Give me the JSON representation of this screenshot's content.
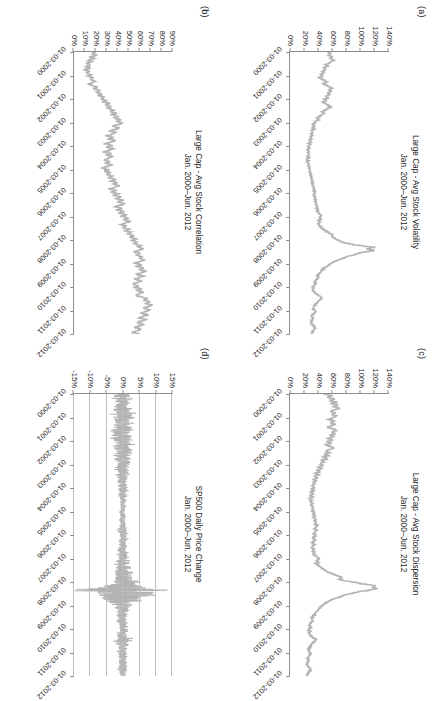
{
  "figure": {
    "orientation": "landscape-rotated-90cw",
    "series_color": "#b3b3b3",
    "axis_color": "#8e8e8e",
    "grid_color": "#bdbdbd"
  },
  "panels": [
    {
      "tag": "(a)",
      "title": "Large Cap - Avg Stock Volatility\nJan. 2000–Jun. 2012",
      "chart_data": {
        "type": "line",
        "title": "Large Cap - Avg Stock Volatility",
        "subtitle": "Jan. 2000–Jun. 2012",
        "xlabel": "",
        "ylabel": "",
        "grid": false,
        "legend": "none",
        "ylim": [
          0,
          140
        ],
        "ytick_labels": [
          "140%",
          "120%",
          "100%",
          "80%",
          "60%",
          "40%",
          "20%",
          "0%"
        ],
        "ytick_values": [
          140,
          120,
          100,
          80,
          60,
          40,
          20,
          0
        ],
        "xtick_labels": [
          "01-03-2000",
          "01-03-2001",
          "01-03-2002",
          "01-03-2003",
          "01-03-2004",
          "01-03-2005",
          "01-03-2006",
          "01-03-2007",
          "01-03-2008",
          "01-03-2009",
          "01-03-2010",
          "01-03-2011",
          "01-03-2012"
        ],
        "series": [
          {
            "name": "Avg Stock Volatility",
            "units": "percent",
            "values": [
              52,
              57,
              54,
              60,
              56,
              62,
              58,
              55,
              50,
              53,
              47,
              50,
              45,
              48,
              43,
              46,
              41,
              44,
              48,
              52,
              46,
              50,
              55,
              59,
              54,
              58,
              52,
              56,
              50,
              54,
              48,
              52,
              46,
              50,
              54,
              58,
              52,
              49,
              45,
              48,
              44,
              41,
              38,
              40,
              36,
              34,
              32,
              34,
              31,
              33,
              30,
              32,
              29,
              31,
              28,
              30,
              27,
              29,
              26,
              28,
              25,
              27,
              24,
              26,
              25,
              27,
              24,
              26,
              23,
              25,
              24,
              26,
              25,
              27,
              26,
              28,
              27,
              29,
              28,
              30,
              29,
              31,
              30,
              32,
              31,
              33,
              32,
              34,
              33,
              35,
              34,
              33,
              35,
              34,
              36,
              35,
              37,
              36,
              38,
              37,
              39,
              38,
              40,
              42,
              44,
              41,
              43,
              40,
              42,
              39,
              41,
              43,
              45,
              48,
              52,
              56,
              60,
              58,
              62,
              66,
              70,
              75,
              85,
              100,
              118,
              110,
              120,
              105,
              95,
              88,
              80,
              74,
              68,
              62,
              58,
              55,
              52,
              48,
              46,
              44,
              42,
              40,
              38,
              40,
              38,
              36,
              34,
              36,
              34,
              32,
              33,
              31,
              33,
              35,
              38,
              42,
              45,
              43,
              40,
              38,
              36,
              34,
              33,
              32,
              34,
              36,
              33,
              31,
              30,
              32,
              31,
              30,
              29,
              31,
              33,
              35,
              34,
              32,
              31,
              30
            ]
          }
        ]
      }
    },
    {
      "tag": "(c)",
      "title": "Large Cap - Avg Stock Dispersion\nJan. 2000–Jun. 2012",
      "chart_data": {
        "type": "line",
        "title": "Large Cap - Avg Stock Dispersion",
        "subtitle": "Jan. 2000–Jun. 2012",
        "xlabel": "",
        "ylabel": "",
        "grid": false,
        "legend": "none",
        "ylim": [
          0,
          140
        ],
        "ytick_labels": [
          "140%",
          "120%",
          "100%",
          "80%",
          "60%",
          "40%",
          "20%",
          "0%"
        ],
        "ytick_values": [
          140,
          120,
          100,
          80,
          60,
          40,
          20,
          0
        ],
        "xtick_labels": [
          "01-03-2000",
          "01-03-2001",
          "01-03-2002",
          "01-03-2003",
          "01-03-2004",
          "01-03-2005",
          "01-03-2006",
          "01-03-2007",
          "01-03-2008",
          "01-03-2009",
          "01-03-2010",
          "01-03-2011",
          "01-03-2012"
        ],
        "series": [
          {
            "name": "Avg Stock Dispersion",
            "units": "percent",
            "values": [
              48,
              58,
              52,
              62,
              55,
              65,
              58,
              68,
              60,
              70,
              62,
              56,
              64,
              58,
              66,
              60,
              54,
              62,
              56,
              64,
              58,
              52,
              60,
              66,
              58,
              64,
              56,
              62,
              54,
              60,
              52,
              58,
              50,
              56,
              62,
              55,
              50,
              56,
              48,
              54,
              46,
              52,
              44,
              48,
              42,
              46,
              40,
              44,
              38,
              42,
              36,
              40,
              34,
              38,
              33,
              36,
              32,
              35,
              31,
              34,
              30,
              33,
              29,
              32,
              28,
              31,
              27,
              30,
              28,
              31,
              29,
              32,
              30,
              33,
              31,
              34,
              32,
              35,
              33,
              36,
              34,
              37,
              35,
              38,
              36,
              34,
              37,
              35,
              33,
              36,
              34,
              32,
              35,
              33,
              31,
              34,
              32,
              30,
              33,
              31,
              34,
              32,
              35,
              38,
              41,
              37,
              40,
              36,
              39,
              42,
              45,
              48,
              52,
              56,
              62,
              68,
              74,
              68,
              80,
              92,
              105,
              120,
              118,
              122,
              108,
              95,
              84,
              76,
              70,
              64,
              58,
              54,
              50,
              46,
              44,
              42,
              40,
              38,
              36,
              34,
              33,
              31,
              30,
              32,
              30,
              28,
              27,
              29,
              27,
              26,
              28,
              26,
              28,
              30,
              33,
              36,
              34,
              32,
              30,
              28,
              27,
              26,
              25,
              27,
              29,
              27,
              25,
              24,
              26,
              25,
              24,
              23,
              25,
              27,
              29,
              27,
              25,
              24,
              23
            ]
          }
        ]
      }
    },
    {
      "tag": "(b)",
      "title": "Large Cap - Avg Stock Correlation\nJan. 2000–Jun. 2012",
      "chart_data": {
        "type": "line",
        "title": "Large Cap - Avg Stock Correlation",
        "subtitle": "Jan. 2000–Jun. 2012",
        "xlabel": "",
        "ylabel": "",
        "grid": false,
        "legend": "none",
        "ylim": [
          0,
          90
        ],
        "ytick_labels": [
          "90%",
          "80%",
          "70%",
          "60%",
          "50%",
          "40%",
          "30%",
          "20%",
          "10%",
          "0%"
        ],
        "ytick_values": [
          90,
          80,
          70,
          60,
          50,
          40,
          30,
          20,
          10,
          0
        ],
        "xtick_labels": [
          "01-03-2000",
          "01-03-2001",
          "01-03-2002",
          "01-03-2003",
          "01-03-2004",
          "01-03-2005",
          "01-03-2006",
          "01-03-2007",
          "01-03-2008",
          "01-03-2009",
          "01-03-2010",
          "01-03-2011",
          "01-03-2012"
        ],
        "series": [
          {
            "name": "Avg Stock Correlation",
            "units": "percent",
            "values": [
              20,
              17,
              22,
              15,
              19,
              13,
              17,
              12,
              16,
              11,
              15,
              10,
              14,
              12,
              16,
              13,
              18,
              15,
              20,
              17,
              14,
              18,
              22,
              19,
              24,
              21,
              26,
              23,
              28,
              25,
              30,
              27,
              33,
              29,
              35,
              31,
              37,
              33,
              39,
              35,
              41,
              37,
              43,
              39,
              45,
              41,
              36,
              42,
              38,
              33,
              39,
              35,
              30,
              36,
              32,
              38,
              34,
              29,
              35,
              31,
              37,
              33,
              28,
              34,
              30,
              36,
              32,
              27,
              33,
              29,
              35,
              31,
              26,
              32,
              28,
              34,
              30,
              36,
              32,
              38,
              34,
              40,
              36,
              42,
              38,
              33,
              39,
              35,
              41,
              37,
              43,
              39,
              45,
              41,
              47,
              43,
              38,
              44,
              40,
              46,
              42,
              48,
              44,
              50,
              46,
              52,
              48,
              43,
              49,
              45,
              51,
              47,
              53,
              49,
              55,
              51,
              57,
              53,
              59,
              55,
              62,
              58,
              64,
              60,
              55,
              61,
              57,
              63,
              59,
              65,
              61,
              56,
              62,
              58,
              64,
              60,
              66,
              62,
              58,
              64,
              60,
              56,
              62,
              58,
              54,
              60,
              56,
              62,
              58,
              64,
              60,
              56,
              62,
              68,
              64,
              70,
              66,
              72,
              68,
              64,
              70,
              66,
              62,
              68,
              64,
              60,
              66,
              62,
              58,
              64,
              60,
              56,
              62,
              58,
              54,
              60
            ]
          }
        ]
      }
    },
    {
      "tag": "(d)",
      "title": "SP500 Daily Price Change\nJan. 2000–Jun. 2012",
      "chart_data": {
        "type": "line",
        "title": "SP500 Daily Price Change",
        "subtitle": "Jan. 2000–Jun. 2012",
        "xlabel": "",
        "ylabel": "",
        "grid": true,
        "legend": "none",
        "ylim": [
          -15,
          15
        ],
        "ytick_labels": [
          "15%",
          "10%",
          "5%",
          "0%",
          "-5%",
          "-10%",
          "-15%"
        ],
        "ytick_values": [
          15,
          10,
          5,
          0,
          -5,
          -10,
          -15
        ],
        "xtick_labels": [
          "01-03-2000",
          "01-03-2001",
          "01-03-2002",
          "01-03-2003",
          "01-03-2004",
          "01-03-2005",
          "01-03-2006",
          "01-03-2007",
          "01-03-2008",
          "01-03-2009",
          "01-03-2010",
          "01-03-2011",
          "01-03-2012"
        ],
        "series": [
          {
            "name": "SP500 Daily Price Change",
            "units": "percent",
            "note": "daily returns, high-frequency noise band; extremes near +11% and -9% in late 2008",
            "volatility_envelope": [
              2.0,
              2.4,
              2.2,
              2.6,
              2.3,
              2.0,
              2.5,
              2.2,
              1.9,
              2.4,
              2.1,
              2.6,
              2.3,
              2.0,
              2.5,
              2.2,
              2.7,
              2.4,
              2.1,
              2.6,
              2.3,
              2.8,
              2.5,
              2.2,
              2.7,
              2.4,
              2.9,
              2.6,
              2.3,
              2.8,
              2.5,
              2.2,
              2.7,
              2.4,
              2.1,
              2.6,
              2.3,
              2.0,
              2.4,
              2.1,
              1.8,
              2.2,
              1.9,
              1.6,
              2.0,
              1.7,
              1.4,
              1.8,
              1.5,
              1.2,
              1.6,
              1.3,
              1.0,
              1.4,
              1.1,
              0.9,
              1.2,
              1.0,
              0.8,
              1.1,
              0.9,
              0.7,
              1.0,
              0.8,
              0.6,
              0.9,
              0.7,
              0.6,
              0.8,
              0.7,
              0.6,
              0.8,
              0.7,
              0.9,
              0.8,
              1.0,
              0.9,
              1.1,
              1.0,
              1.2,
              1.1,
              1.3,
              1.2,
              1.0,
              1.2,
              1.1,
              0.9,
              1.1,
              1.0,
              1.2,
              1.1,
              1.3,
              1.2,
              1.4,
              1.3,
              1.5,
              1.4,
              1.6,
              1.5,
              1.7,
              1.6,
              1.8,
              2.0,
              2.3,
              2.6,
              2.2,
              2.5,
              2.8,
              3.2,
              3.6,
              4.2,
              5.0,
              6.5,
              8.5,
              10.5,
              9.0,
              11.0,
              8.0,
              6.5,
              5.5,
              4.5,
              3.8,
              3.2,
              2.8,
              2.4,
              2.1,
              1.8,
              1.6,
              1.4,
              1.6,
              1.4,
              1.2,
              1.4,
              1.2,
              1.0,
              1.2,
              1.0,
              1.3,
              1.1,
              1.4,
              1.2,
              1.6,
              2.2,
              2.8,
              2.4,
              2.0,
              1.7,
              1.5,
              1.3,
              1.1,
              1.3,
              1.1,
              1.0,
              1.2,
              1.0,
              0.9,
              1.1,
              1.0,
              0.9,
              1.1,
              1.3,
              1.1,
              1.0,
              0.9,
              1.0
            ]
          }
        ]
      }
    }
  ]
}
